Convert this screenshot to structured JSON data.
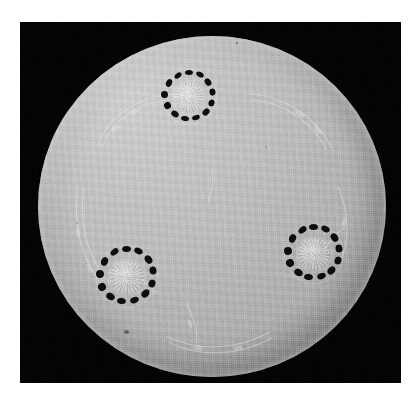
{
  "image": {
    "subject": "circular cutwork linen doily",
    "caption": "",
    "medium": "black and white photograph",
    "background_color": "#ffffff",
    "frame_color": "#000000",
    "fabric_color": "#bababa",
    "cutwork_color": "#0a0a0a"
  },
  "frame": {
    "x": 20,
    "y": 22,
    "width": 381,
    "height": 361
  },
  "doily": {
    "label": "circular linen doily",
    "center_x": 212,
    "center_y": 202,
    "radius": 174,
    "shape": "circle"
  },
  "medallions": [
    {
      "id": "medallion-top",
      "label": "top cutwork medallion",
      "center_x": 189,
      "center_y": 97,
      "outer_radius": 28,
      "hole_count": 13,
      "center_motif": "floral rosette"
    },
    {
      "id": "medallion-lower-left",
      "label": "lower-left cutwork medallion",
      "center_x": 127,
      "center_y": 277,
      "outer_radius": 31,
      "hole_count": 13,
      "center_motif": "floral rosette"
    },
    {
      "id": "medallion-right",
      "label": "right cutwork medallion",
      "center_x": 314,
      "center_y": 254,
      "outer_radius": 30,
      "hole_count": 13,
      "center_motif": "floral rosette"
    }
  ],
  "embroidery": {
    "label": "tone-on-tone embroidered vine and leaf scrollwork",
    "visible": true
  },
  "flaws": [
    {
      "id": "speck-top",
      "x": 216,
      "y": 38,
      "size": 2
    },
    {
      "id": "speck-center",
      "x": 245,
      "y": 142,
      "size": 2
    },
    {
      "id": "speck-lower-left",
      "x": 106,
      "y": 326,
      "size": 4
    },
    {
      "id": "speck-left-edge",
      "x": 56,
      "y": 218,
      "size": 2
    }
  ]
}
